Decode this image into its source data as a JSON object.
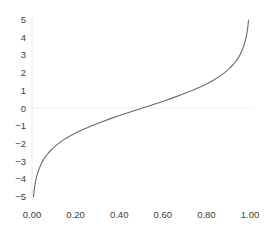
{
  "chart_data": {
    "type": "line",
    "title": "",
    "subtitle": "",
    "xlabel": "",
    "ylabel": "",
    "xlim": [
      0.0,
      1.0
    ],
    "ylim": [
      -5,
      5
    ],
    "grid": false,
    "legend": null,
    "zero_line": true,
    "function": "logit: y = ln(p/(1-p))",
    "series": [
      {
        "name": "logit",
        "color": "#6b6b6b",
        "x": [
          0.0067,
          0.01,
          0.015,
          0.02,
          0.027,
          0.036,
          0.047,
          0.06,
          0.076,
          0.095,
          0.119,
          0.141,
          0.168,
          0.198,
          0.231,
          0.269,
          0.31,
          0.354,
          0.401,
          0.45,
          0.5,
          0.55,
          0.599,
          0.646,
          0.69,
          0.731,
          0.769,
          0.802,
          0.832,
          0.858,
          0.881,
          0.905,
          0.924,
          0.94,
          0.953,
          0.964,
          0.973,
          0.98,
          0.985,
          0.99,
          0.9933
        ],
        "y": [
          -5.0,
          -4.6,
          -4.2,
          -3.9,
          -3.6,
          -3.3,
          -3.0,
          -2.75,
          -2.5,
          -2.25,
          -2.0,
          -1.8,
          -1.6,
          -1.4,
          -1.2,
          -1.0,
          -0.8,
          -0.6,
          -0.4,
          -0.2,
          0.0,
          0.2,
          0.4,
          0.6,
          0.8,
          1.0,
          1.2,
          1.4,
          1.6,
          1.8,
          2.0,
          2.25,
          2.5,
          2.75,
          3.0,
          3.3,
          3.6,
          3.9,
          4.2,
          4.6,
          5.0
        ]
      }
    ],
    "x_ticks": [
      {
        "value": 0.0,
        "label": "0.00"
      },
      {
        "value": 0.2,
        "label": "0.20"
      },
      {
        "value": 0.4,
        "label": "0.40"
      },
      {
        "value": 0.6,
        "label": "0.60"
      },
      {
        "value": 0.8,
        "label": "0.80"
      },
      {
        "value": 1.0,
        "label": "1.00"
      }
    ],
    "y_ticks": [
      {
        "value": 5,
        "label": "5"
      },
      {
        "value": 4,
        "label": "4"
      },
      {
        "value": 3,
        "label": "3"
      },
      {
        "value": 2,
        "label": "2"
      },
      {
        "value": 1,
        "label": "1"
      },
      {
        "value": 0,
        "label": "0"
      },
      {
        "value": -1,
        "label": "−1"
      },
      {
        "value": -2,
        "label": "−2"
      },
      {
        "value": -3,
        "label": "−3"
      },
      {
        "value": -4,
        "label": "−4"
      },
      {
        "value": -5,
        "label": "−5"
      }
    ],
    "colors": {
      "background": "#ffffff",
      "curve": "#6b6b6b",
      "axis": "#ededed",
      "zero_line": "#f2eeee",
      "tick_text": "#3d3d3d"
    }
  }
}
